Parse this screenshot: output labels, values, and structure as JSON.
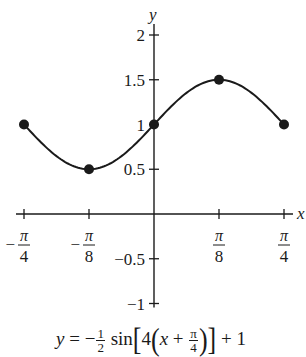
{
  "chart_data": {
    "type": "line",
    "title": "",
    "xlabel": "x",
    "ylabel": "y",
    "equation": "y = -1/2 sin[4(x + π/4)] + 1",
    "equation_parts": {
      "lhs": "y",
      "eq": "=",
      "minus": "−",
      "coef_num": "1",
      "coef_den": "2",
      "func": "sin",
      "inner_coef": "4",
      "var": "x",
      "plus": "+",
      "shift_num": "π",
      "shift_den": "4",
      "vertical_shift": "+ 1"
    },
    "xlim": [
      -0.7854,
      0.7854
    ],
    "ylim": [
      -1,
      2
    ],
    "x_ticks": [
      {
        "value": -0.7854,
        "num": "π",
        "den": "4",
        "neg": true
      },
      {
        "value": -0.3927,
        "num": "π",
        "den": "8",
        "neg": true
      },
      {
        "value": 0.3927,
        "num": "π",
        "den": "8",
        "neg": false
      },
      {
        "value": 0.7854,
        "num": "π",
        "den": "4",
        "neg": false
      }
    ],
    "y_ticks": [
      {
        "value": 2,
        "label": "2"
      },
      {
        "value": 1.5,
        "label": "1.5"
      },
      {
        "value": 1,
        "label": "1"
      },
      {
        "value": 0.5,
        "label": "0.5"
      },
      {
        "value": -0.5,
        "label": "−0.5"
      },
      {
        "value": -1,
        "label": "−1"
      }
    ],
    "points": [
      {
        "x": -0.7854,
        "x_label": "-π/4",
        "y": 1
      },
      {
        "x": -0.3927,
        "x_label": "-π/8",
        "y": 0.5
      },
      {
        "x": 0,
        "x_label": "0",
        "y": 1
      },
      {
        "x": 0.3927,
        "x_label": "π/8",
        "y": 1.5
      },
      {
        "x": 0.7854,
        "x_label": "π/4",
        "y": 1
      }
    ],
    "grid": false,
    "legend": null
  },
  "colors": {
    "ink": "#1a1a1a",
    "background": "#ffffff"
  }
}
